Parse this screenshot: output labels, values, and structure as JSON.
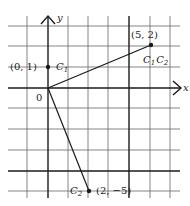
{
  "diagram": {
    "type": "vector-plot",
    "grid": {
      "x_range": [
        -1,
        6
      ],
      "y_range": [
        -5,
        3
      ],
      "heavy_lines": {
        "x": [
          0,
          4
        ],
        "y": [
          0,
          -4
        ]
      }
    },
    "axes": {
      "x_label": "x",
      "y_label": "y",
      "origin_label": "0"
    },
    "points": [
      {
        "id": "p1",
        "coord_label": "(0, 1)",
        "name": "C",
        "sub": "1",
        "x": 0,
        "y": 1
      },
      {
        "id": "p2",
        "coord_label": "(5, 2)",
        "name1": "C",
        "sub1": "1",
        "name2": "C",
        "sub2": "2",
        "x": 5,
        "y": 2
      },
      {
        "id": "p3",
        "coord_label": "(2, −5)",
        "name": "C",
        "sub": "2",
        "x": 2,
        "y": -5
      }
    ],
    "segments": [
      {
        "from": [
          0,
          0
        ],
        "to": [
          5,
          2
        ]
      },
      {
        "from": [
          0,
          0
        ],
        "to": [
          2,
          -5
        ]
      }
    ],
    "colors": {
      "ink": "#1a1a1a",
      "grid": "#555555",
      "background": "#ffffff"
    }
  }
}
